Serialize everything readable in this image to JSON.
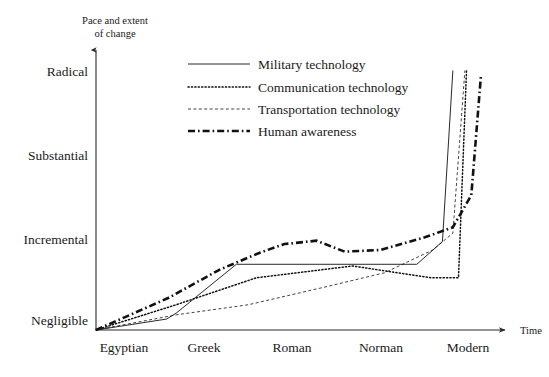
{
  "chart_data": {
    "type": "line",
    "title": "",
    "ylabel": "Pace and extent of change",
    "ylabel_line1": "Pace and extent",
    "ylabel_line2": "of change",
    "xlabel": "Time",
    "grid": false,
    "legend_position": "upper-center",
    "categories": [
      "Egyptian",
      "Greek",
      "Roman",
      "Norman",
      "Modern"
    ],
    "ytick_labels": [
      "Negligible",
      "Incremental",
      "Substantial",
      "Radical"
    ],
    "ytick_values": [
      0,
      1,
      2,
      3
    ],
    "ylim": [
      0,
      3.3
    ],
    "xlim": [
      0,
      5.1
    ],
    "category_x": [
      0,
      1,
      2,
      3,
      4
    ],
    "series": [
      {
        "name": "Military technology",
        "style": "solid",
        "x": [
          0,
          0.88,
          1.0,
          1.75,
          4.0,
          4.32,
          4.45
        ],
        "values": [
          0,
          0.13,
          0.2,
          0.78,
          0.78,
          1.05,
          3.08
        ]
      },
      {
        "name": "Communication technology",
        "style": "dotted",
        "x": [
          0,
          1.0,
          2.0,
          3.2,
          4.18,
          4.52,
          4.62
        ],
        "values": [
          0,
          0.3,
          0.62,
          0.76,
          0.62,
          0.62,
          3.08
        ]
      },
      {
        "name": "Transportation technology",
        "style": "dashed",
        "x": [
          0,
          1.0,
          1.9,
          2.9,
          3.6,
          4.2,
          4.45,
          4.6
        ],
        "values": [
          0,
          0.18,
          0.3,
          0.52,
          0.68,
          0.95,
          1.15,
          3.08
        ]
      },
      {
        "name": "Human awareness",
        "style": "dash-dot",
        "x": [
          0,
          0.9,
          1.55,
          2.05,
          2.35,
          2.75,
          3.1,
          3.55,
          4.1,
          4.45,
          4.68,
          4.8
        ],
        "values": [
          0,
          0.38,
          0.72,
          0.92,
          1.02,
          1.06,
          0.93,
          0.95,
          1.1,
          1.22,
          1.6,
          3.02
        ]
      }
    ]
  },
  "legend": {
    "items": [
      {
        "label": "Military technology",
        "style": "solid"
      },
      {
        "label": "Communication technology",
        "style": "dotted"
      },
      {
        "label": "Transportation technology",
        "style": "dashed"
      },
      {
        "label": "Human awareness",
        "style": "dash-dot"
      }
    ]
  },
  "colors": {
    "ink": "#1a1a1a",
    "axis": "#2b2b2b",
    "background": "#ffffff"
  }
}
